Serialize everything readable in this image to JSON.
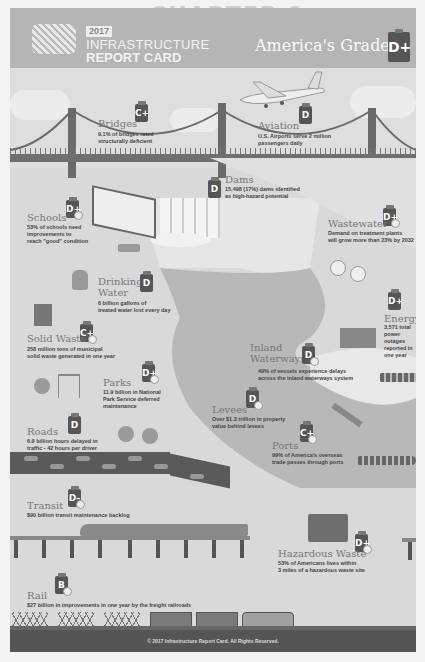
{
  "background_page": {
    "watermark_line1": "CHAPTER 1",
    "watermark_line2": "Introduction"
  },
  "header": {
    "year": "2017",
    "title_line1": "INFRASTRUCTURE",
    "title_line2": "REPORT CARD",
    "overall_label": "America's Grade:",
    "overall_grade": "D+"
  },
  "categories": [
    {
      "name": "Bridges",
      "grade": "C+",
      "desc_line1": "9.1% of bridges rated",
      "desc_line2": "structurally deficient"
    },
    {
      "name": "Aviation",
      "grade": "D",
      "desc_line1": "U.S. Airports serve 2 million",
      "desc_line2": "passengers daily"
    },
    {
      "name": "Dams",
      "grade": "D",
      "desc_line1": "15,498 (17%) dams identified",
      "desc_line2": "as high-hazard potential"
    },
    {
      "name": "Schools",
      "grade": "D+",
      "desc_line1": "53% of schools need",
      "desc_line2": "improvements to",
      "desc_line3": "reach \"good\" condition"
    },
    {
      "name": "Wastewater",
      "grade": "D+",
      "desc_line1": "Demand on treatment plants",
      "desc_line2": "will grow more than 23% by 2032"
    },
    {
      "name_line1": "Drinking",
      "name_line2": "Water",
      "grade": "D",
      "desc_line1": "6 billion gallons of",
      "desc_line2": "treated water lost every day"
    },
    {
      "name": "Energy",
      "grade": "D+",
      "desc_line1": "3,571 total",
      "desc_line2": "power outages",
      "desc_line3": "reported in",
      "desc_line4": "one year"
    },
    {
      "name": "Solid Waste",
      "grade": "C+",
      "desc_line1": "258 million tons of municipal",
      "desc_line2": "solid waste generated in one year"
    },
    {
      "name_line1": "Inland",
      "name_line2": "Waterways",
      "grade": "D",
      "desc_line1": "49% of vessels experience delays",
      "desc_line2": "across the inland waterways system"
    },
    {
      "name": "Parks",
      "grade": "D+",
      "desc_line1": "11.9 billion in National",
      "desc_line2": "Park Service deferred",
      "desc_line3": "maintenance"
    },
    {
      "name": "Levees",
      "grade": "D",
      "desc_line1": "Over $1.3 trillion in property",
      "desc_line2": "value behind levees"
    },
    {
      "name": "Roads",
      "grade": "D",
      "desc_line1": "6.9 billion hours delayed in",
      "desc_line2": "traffic - 42 hours per driver"
    },
    {
      "name": "Ports",
      "grade": "C+",
      "desc_line1": "99% of America's overseas",
      "desc_line2": "trade passes through ports"
    },
    {
      "name": "Transit",
      "grade": "D-",
      "desc_line1": "$90 billion transit maintenance backlog"
    },
    {
      "name": "Hazardous Waste",
      "grade": "D+",
      "desc_line1": "53% of Americans lives within",
      "desc_line2": "3 miles of a hazardous waste site"
    },
    {
      "name": "Rail",
      "grade": "B",
      "desc_line1": "$27 billion in improvements in one year by the freight railroads"
    }
  ],
  "footer": {
    "copyright": "© 2017 Infrastructure Report Card. All Rights Reserved."
  },
  "colors": {
    "panel_bg": "#d9d9d9",
    "header_bg": "#b5b5b5",
    "grade_badge": "#555555",
    "label_text": "#777777",
    "footer_bg": "#555555"
  }
}
